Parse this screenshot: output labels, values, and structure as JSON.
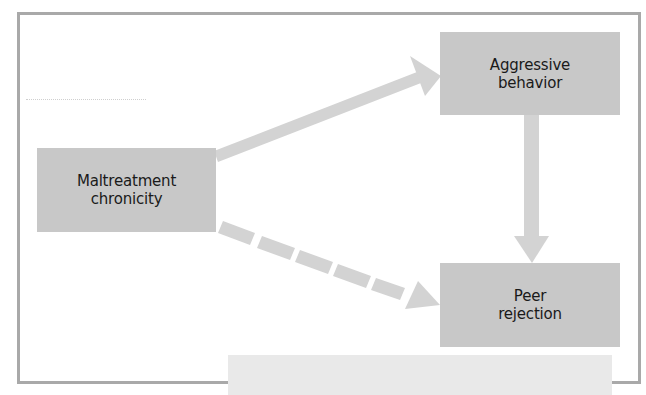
{
  "diagram": {
    "type": "path-model",
    "nodes": [
      {
        "id": "maltreatment",
        "lines": [
          "Maltreatment",
          "chronicity"
        ]
      },
      {
        "id": "aggressive",
        "lines": [
          "Aggressive",
          "behavior"
        ]
      },
      {
        "id": "peer",
        "lines": [
          "Peer",
          "rejection"
        ]
      }
    ],
    "edges": [
      {
        "from": "maltreatment",
        "to": "aggressive",
        "style": "solid"
      },
      {
        "from": "aggressive",
        "to": "peer",
        "style": "solid"
      },
      {
        "from": "maltreatment",
        "to": "peer",
        "style": "dashed"
      }
    ]
  },
  "colors": {
    "frame": "#a9a9a9",
    "node_fill": "#c8c8c8",
    "arrow": "#d3d3d3",
    "text": "#1a1a1a",
    "strip": "#e9e9e9"
  }
}
